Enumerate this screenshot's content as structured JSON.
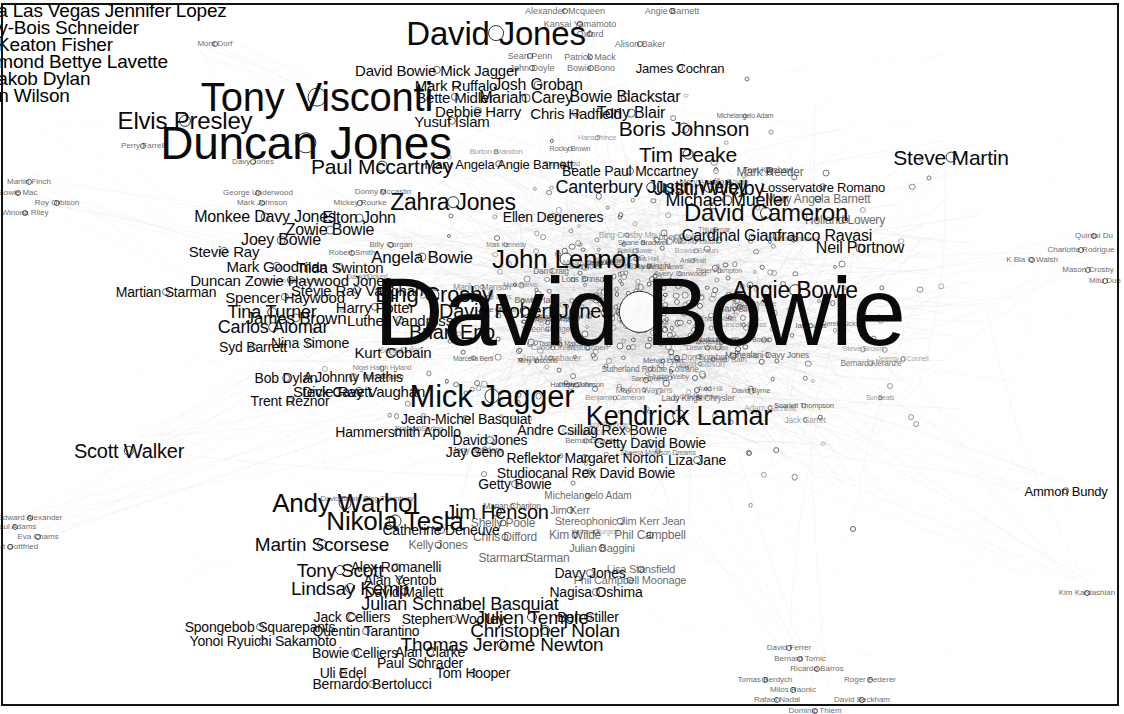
{
  "graph": {
    "title": "David Bowie co-occurrence network",
    "type": "force-directed-label-graph",
    "background": "#ffffff",
    "label_color": "#0a0a0a",
    "node_fill": "#ffffff",
    "node_stroke": "#2b2b2b",
    "edge_color": "#b9b9b9",
    "border_color": "#111111"
  },
  "chart_data": {
    "type": "scatter",
    "xlabel": "",
    "ylabel": "",
    "xlim": [
      0,
      1124
    ],
    "ylim": [
      0,
      714
    ],
    "grid": false,
    "legend": "none",
    "nodes": [
      {
        "label": "David Bowie",
        "x": 640,
        "y": 312,
        "size": 96
      },
      {
        "label": "Duncan Jones",
        "x": 306,
        "y": 143,
        "size": 46
      },
      {
        "label": "Tony Visconti",
        "x": 317,
        "y": 97,
        "size": 40
      },
      {
        "label": "David Jones",
        "x": 496,
        "y": 33,
        "size": 33
      },
      {
        "label": "Mick Jagger",
        "x": 492,
        "y": 396,
        "size": 31
      },
      {
        "label": "Kendrick Lamar",
        "x": 679,
        "y": 416,
        "size": 27
      },
      {
        "label": "John Lennon",
        "x": 566,
        "y": 259,
        "size": 26
      },
      {
        "label": "Andy Warhol",
        "x": 345,
        "y": 503,
        "size": 26
      },
      {
        "label": "Nikola Tesla",
        "x": 395,
        "y": 521,
        "size": 26
      },
      {
        "label": "Elvis Presley",
        "x": 185,
        "y": 121,
        "size": 24
      },
      {
        "label": "David Cameron",
        "x": 766,
        "y": 213,
        "size": 24
      },
      {
        "label": "Zahra Jones",
        "x": 453,
        "y": 202,
        "size": 23
      },
      {
        "label": "Angie Bowie",
        "x": 795,
        "y": 290,
        "size": 23
      },
      {
        "label": "Bing Crosby",
        "x": 434,
        "y": 295,
        "size": 22
      },
      {
        "label": "Paul Mccartney",
        "x": 382,
        "y": 166,
        "size": 21
      },
      {
        "label": "Steve Martin",
        "x": 951,
        "y": 157,
        "size": 21
      },
      {
        "label": "Boris Johnson",
        "x": 684,
        "y": 128,
        "size": 21
      },
      {
        "label": "Tim Peake",
        "x": 688,
        "y": 154,
        "size": 21
      },
      {
        "label": "Justin Welby",
        "x": 709,
        "y": 188,
        "size": 20
      },
      {
        "label": "Scott Walker",
        "x": 129,
        "y": 451,
        "size": 20
      },
      {
        "label": "Jim Henson",
        "x": 497,
        "y": 512,
        "size": 20
      },
      {
        "label": "David Robert Jones",
        "x": 525,
        "y": 311,
        "size": 20
      },
      {
        "label": "Brian Eno",
        "x": 452,
        "y": 332,
        "size": 20
      },
      {
        "label": "Martin Scorsese",
        "x": 322,
        "y": 544,
        "size": 19
      },
      {
        "label": "Lindsay Kemp",
        "x": 350,
        "y": 588,
        "size": 19
      },
      {
        "label": "Tony Scott",
        "x": 340,
        "y": 570,
        "size": 19
      },
      {
        "label": "Thomas Jerome Newton",
        "x": 502,
        "y": 644,
        "size": 19
      },
      {
        "label": "Christopher Nolan",
        "x": 545,
        "y": 630,
        "size": 19
      },
      {
        "label": "Julien Temple",
        "x": 532,
        "y": 617,
        "size": 19
      },
      {
        "label": "Julian Schnabel Basquiat",
        "x": 460,
        "y": 604,
        "size": 18
      },
      {
        "label": "Michael Mueller",
        "x": 727,
        "y": 200,
        "size": 18
      },
      {
        "label": "Canterbury Justin Welby",
        "x": 651,
        "y": 187,
        "size": 18
      },
      {
        "label": "Tina Turner",
        "x": 272,
        "y": 312,
        "size": 18
      },
      {
        "label": "Carlos Alomar",
        "x": 273,
        "y": 327,
        "size": 18
      },
      {
        "label": "James Brown",
        "x": 296,
        "y": 318,
        "size": 17
      },
      {
        "label": "Angela Bowie",
        "x": 422,
        "y": 257,
        "size": 17
      },
      {
        "label": "Monkee Davy Jones",
        "x": 265,
        "y": 217,
        "size": 16
      },
      {
        "label": "Elton John",
        "x": 359,
        "y": 218,
        "size": 16
      },
      {
        "label": "Zowie Bowie",
        "x": 330,
        "y": 230,
        "size": 16
      },
      {
        "label": "Joey Bowie",
        "x": 281,
        "y": 240,
        "size": 16
      },
      {
        "label": "Cardinal Gianfranco Ravasi",
        "x": 777,
        "y": 236,
        "size": 16
      },
      {
        "label": "Neil Portnow",
        "x": 860,
        "y": 248,
        "size": 16
      },
      {
        "label": "Tony Blair",
        "x": 631,
        "y": 113,
        "size": 16
      },
      {
        "label": "Bowie Blackstar",
        "x": 625,
        "y": 97,
        "size": 16
      },
      {
        "label": "Mariah Carey",
        "x": 526,
        "y": 98,
        "size": 16
      },
      {
        "label": "Josh Groban",
        "x": 538,
        "y": 85,
        "size": 16
      },
      {
        "label": "Chris Hadfield",
        "x": 576,
        "y": 113,
        "size": 15
      },
      {
        "label": "Debbie Harry",
        "x": 478,
        "y": 111,
        "size": 15
      },
      {
        "label": "Bette Midler",
        "x": 455,
        "y": 97,
        "size": 15
      },
      {
        "label": "Mark Ruffalo",
        "x": 456,
        "y": 85,
        "size": 15
      },
      {
        "label": "David Bowie Mick Jagger",
        "x": 437,
        "y": 70,
        "size": 15
      },
      {
        "label": "Yusuf Islam",
        "x": 452,
        "y": 121,
        "size": 15
      },
      {
        "label": "Duncan Zowie Haywood Jones",
        "x": 291,
        "y": 280,
        "size": 15
      },
      {
        "label": "Spencer Haywood",
        "x": 285,
        "y": 297,
        "size": 15
      },
      {
        "label": "Mark Goodman",
        "x": 277,
        "y": 266,
        "size": 15
      },
      {
        "label": "Tilda Swinton",
        "x": 340,
        "y": 267,
        "size": 15
      },
      {
        "label": "Stevie Ray Vaughan",
        "x": 359,
        "y": 391,
        "size": 15
      },
      {
        "label": "Stevie Ray Vaughan ",
        "x": 357,
        "y": 290,
        "size": 15
      },
      {
        "label": "Harry Potter",
        "x": 375,
        "y": 307,
        "size": 15
      },
      {
        "label": "Luther Vandross",
        "x": 400,
        "y": 320,
        "size": 15
      },
      {
        "label": "Stevie Ray",
        "x": 224,
        "y": 251,
        "size": 15
      },
      {
        "label": "Martian Starman",
        "x": 166,
        "y": 292,
        "size": 14
      },
      {
        "label": "Kurt Cobain",
        "x": 393,
        "y": 352,
        "size": 15
      },
      {
        "label": "Syd Barrett",
        "x": 253,
        "y": 347,
        "size": 14
      },
      {
        "label": "Nina Simone",
        "x": 310,
        "y": 343,
        "size": 14
      },
      {
        "label": "Bob Dylan",
        "x": 286,
        "y": 378,
        "size": 14
      },
      {
        "label": "A Johnny Mathis",
        "x": 353,
        "y": 377,
        "size": 14
      },
      {
        "label": "Dick Cavett",
        "x": 337,
        "y": 392,
        "size": 14
      },
      {
        "label": "Trent Reznor",
        "x": 290,
        "y": 401,
        "size": 14
      },
      {
        "label": "Hammersmith Apollo",
        "x": 398,
        "y": 432,
        "size": 14
      },
      {
        "label": "Jean-Michel Basquiat",
        "x": 466,
        "y": 419,
        "size": 14
      },
      {
        "label": "David Jones",
        "x": 490,
        "y": 440,
        "size": 14
      },
      {
        "label": "Jay Geno",
        "x": 475,
        "y": 452,
        "size": 14
      },
      {
        "label": "Reflektor Margaret Norton",
        "x": 585,
        "y": 458,
        "size": 14
      },
      {
        "label": "Andre Csillag Rex Bowie",
        "x": 592,
        "y": 430,
        "size": 14
      },
      {
        "label": "Getty David Bowie",
        "x": 650,
        "y": 443,
        "size": 14
      },
      {
        "label": "Liza Jane",
        "x": 697,
        "y": 460,
        "size": 14
      },
      {
        "label": "Studiocanal Rex David Bowie",
        "x": 586,
        "y": 473,
        "size": 14
      },
      {
        "label": "Getty Bowie",
        "x": 515,
        "y": 484,
        "size": 14
      },
      {
        "label": "Catherine Deneuve",
        "x": 441,
        "y": 530,
        "size": 14
      },
      {
        "label": "Alex Romanelli",
        "x": 396,
        "y": 567,
        "size": 14
      },
      {
        "label": "Alan Yentob",
        "x": 400,
        "y": 580,
        "size": 14
      },
      {
        "label": "David Mallett",
        "x": 404,
        "y": 592,
        "size": 14
      },
      {
        "label": "Davy Jones",
        "x": 590,
        "y": 573,
        "size": 14
      },
      {
        "label": "Nagisa Oshima",
        "x": 596,
        "y": 592,
        "size": 14
      },
      {
        "label": "Stephen Woolley",
        "x": 453,
        "y": 619,
        "size": 14
      },
      {
        "label": "Jack Celliers",
        "x": 352,
        "y": 617,
        "size": 14
      },
      {
        "label": "Quentin Tarantino",
        "x": 366,
        "y": 631,
        "size": 14
      },
      {
        "label": "Spongebob Squarepants",
        "x": 260,
        "y": 627,
        "size": 14
      },
      {
        "label": "Yonoi Ryuichi Sakamoto",
        "x": 263,
        "y": 641,
        "size": 14
      },
      {
        "label": "Bowie Celliers",
        "x": 355,
        "y": 653,
        "size": 14
      },
      {
        "label": "Alan Clarke",
        "x": 430,
        "y": 652,
        "size": 14
      },
      {
        "label": "Paul Schrader",
        "x": 420,
        "y": 663,
        "size": 14
      },
      {
        "label": "Uli Edel",
        "x": 343,
        "y": 673,
        "size": 14
      },
      {
        "label": "Bernardo Bertolucci",
        "x": 372,
        "y": 684,
        "size": 14
      },
      {
        "label": "Tom Hooper",
        "x": 473,
        "y": 673,
        "size": 14
      },
      {
        "label": "Ben Stiller",
        "x": 588,
        "y": 617,
        "size": 14
      },
      {
        "label": "Kelly Jones",
        "x": 438,
        "y": 545,
        "size": 12
      },
      {
        "label": "Shelly Poole",
        "x": 503,
        "y": 523,
        "size": 12
      },
      {
        "label": "Chris Difford",
        "x": 505,
        "y": 537,
        "size": 12
      },
      {
        "label": "Starman Starman",
        "x": 524,
        "y": 558,
        "size": 12
      },
      {
        "label": "Lisa Stansfield",
        "x": 641,
        "y": 569,
        "size": 11
      },
      {
        "label": "Phil Campbell Moonage",
        "x": 630,
        "y": 580,
        "size": 11
      },
      {
        "label": "Julian Baggini",
        "x": 602,
        "y": 548,
        "size": 11
      },
      {
        "label": "Phil Campbell",
        "x": 650,
        "y": 535,
        "size": 12
      },
      {
        "label": "Kim Wilde",
        "x": 575,
        "y": 535,
        "size": 12
      },
      {
        "label": "Stereophonic Jim Kerr Jean",
        "x": 620,
        "y": 521,
        "size": 11
      },
      {
        "label": "Jim Kerr",
        "x": 570,
        "y": 510,
        "size": 11
      },
      {
        "label": "Michelangelo Adam",
        "x": 588,
        "y": 496,
        "size": 10
      },
      {
        "label": "Ammon Bundy",
        "x": 1066,
        "y": 491,
        "size": 13
      },
      {
        "label": "Ellen Degeneres",
        "x": 553,
        "y": 217,
        "size": 14
      },
      {
        "label": "Mary Angela Angie Barnett",
        "x": 499,
        "y": 164,
        "size": 13
      },
      {
        "label": "Beatle Paul Mccartney",
        "x": 630,
        "y": 171,
        "size": 14
      },
      {
        "label": "Mark Reeder",
        "x": 770,
        "y": 172,
        "size": 12
      },
      {
        "label": "Losservatore Romano",
        "x": 823,
        "y": 187,
        "size": 13
      },
      {
        "label": "Mary Angela Barnett",
        "x": 818,
        "y": 199,
        "size": 12
      },
      {
        "label": "Holland Lowery",
        "x": 845,
        "y": 220,
        "size": 12
      },
      {
        "label": "James Cochran",
        "x": 680,
        "y": 68,
        "size": 13
      },
      {
        "label": "Alexander Mcqueen",
        "x": 565,
        "y": 11,
        "size": 9
      },
      {
        "label": "Angie Barnett",
        "x": 672,
        "y": 11,
        "size": 9
      },
      {
        "label": "Kansai Yamamoto",
        "x": 580,
        "y": 24,
        "size": 9
      },
      {
        "label": "Oxford",
        "x": 590,
        "y": 34,
        "size": 9
      },
      {
        "label": "Alison Baker",
        "x": 640,
        "y": 44,
        "size": 9
      },
      {
        "label": "Sean Penn",
        "x": 530,
        "y": 56,
        "size": 9
      },
      {
        "label": "Patrick Mack",
        "x": 590,
        "y": 57,
        "size": 9
      },
      {
        "label": "John Doyle",
        "x": 532,
        "y": 68,
        "size": 9
      },
      {
        "label": "Bowie Bono",
        "x": 591,
        "y": 68,
        "size": 9
      },
      {
        "label": "Mont Dorf",
        "x": 215,
        "y": 44,
        "size": 8
      },
      {
        "label": "Perry Farrell",
        "x": 143,
        "y": 146,
        "size": 8
      },
      {
        "label": "Davy Jones",
        "x": 253,
        "y": 162,
        "size": 8
      },
      {
        "label": "Mark Johnson",
        "x": 262,
        "y": 203,
        "size": 8
      },
      {
        "label": "George Underwood",
        "x": 258,
        "y": 193,
        "size": 8
      },
      {
        "label": "Mickey Rourke",
        "x": 360,
        "y": 203,
        "size": 8
      },
      {
        "label": "Donny Mccaslin",
        "x": 383,
        "y": 192,
        "size": 8
      },
      {
        "label": "Billy Corgan",
        "x": 391,
        "y": 245,
        "size": 8
      },
      {
        "label": "Robert Smith",
        "x": 352,
        "y": 253,
        "size": 8
      },
      {
        "label": "Martin Finch",
        "x": 29,
        "y": 182,
        "size": 8
      },
      {
        "label": "Bowie Mac",
        "x": 18,
        "y": 193,
        "size": 8
      },
      {
        "label": "Roy Orbison",
        "x": 57,
        "y": 203,
        "size": 8
      },
      {
        "label": "Winona Riley",
        "x": 25,
        "y": 213,
        "size": 8
      },
      {
        "label": "Edward Alexander",
        "x": 30,
        "y": 518,
        "size": 8
      },
      {
        "label": "Paul Adams",
        "x": 15,
        "y": 527,
        "size": 8
      },
      {
        "label": "Eva Chams",
        "x": 38,
        "y": 537,
        "size": 8
      },
      {
        "label": "Gilbert Gottfried",
        "x": 10,
        "y": 547,
        "size": 8
      },
      {
        "label": "Quintoi Du",
        "x": 1094,
        "y": 236,
        "size": 8
      },
      {
        "label": "Charlotte Rodrigue",
        "x": 1081,
        "y": 250,
        "size": 8
      },
      {
        "label": "K Bla O Walsh",
        "x": 1032,
        "y": 260,
        "size": 8
      },
      {
        "label": "Mason Crosby",
        "x": 1088,
        "y": 270,
        "size": 8
      },
      {
        "label": "Mitu Due",
        "x": 1105,
        "y": 281,
        "size": 8
      },
      {
        "label": "Kim Kardashian",
        "x": 1087,
        "y": 593,
        "size": 8
      },
      {
        "label": "David Ferrer",
        "x": 789,
        "y": 648,
        "size": 8
      },
      {
        "label": "Bernard Tomic",
        "x": 800,
        "y": 659,
        "size": 8
      },
      {
        "label": "Ricardo Barros",
        "x": 817,
        "y": 669,
        "size": 8
      },
      {
        "label": "Tomas Berdych",
        "x": 765,
        "y": 680,
        "size": 8
      },
      {
        "label": "Roger Federer",
        "x": 870,
        "y": 680,
        "size": 8
      },
      {
        "label": "Milos Raonic",
        "x": 793,
        "y": 690,
        "size": 8
      },
      {
        "label": "Rafael Nadal",
        "x": 777,
        "y": 700,
        "size": 8
      },
      {
        "label": "David Beckham",
        "x": 862,
        "y": 700,
        "size": 8
      },
      {
        "label": "Dominic Thiem",
        "x": 815,
        "y": 711,
        "size": 8
      }
    ],
    "featured_largest": "David Bowie",
    "node_count_visible": 400
  },
  "clipped_top_left": [
    "va Las Vegas Jennifer Lopez",
    "oy-Bois Schneider",
    "l Keaton Fisher",
    "smond Bettye Lavette",
    "Jakob Dylan",
    "nn Wilson"
  ],
  "small_labels": [
    "Thiu Brnar",
    "Melvin Lynn",
    "Justin Welby",
    "Avery Garwood",
    "Benjamin Cameron",
    "Mark Bryson",
    "Rhys Ahmad",
    "Jack Garret",
    "Chris Hadfield News",
    "Sean Cullen",
    "Tom Kershaw",
    "Amy Mossbauer",
    "Scarlett Thompson",
    "Chris Cooper",
    "Anil Pratt",
    "Sharon Osbourne",
    "Harriette Johnson",
    "Anthony Burgess",
    "Ian Curtis",
    "Conor Green",
    "Shane Bradwell",
    "Matt Cohen",
    "Laura Albornoz",
    "Franco Spring",
    "Jeremy O'Connell",
    "Morgan Mckennis",
    "Jack Brooks",
    "Judy James",
    "John Partridge",
    "Sam Mance",
    "Naomi Pelludo",
    "Tony Wright",
    "Lady Kings Chrysler",
    "Ruth Collins Hall",
    "Da Don Bomber",
    "Adam Gilchrist",
    "Jonathan Chatman",
    "Stephanie Davis",
    "Avery Coman",
    "Hans Prince",
    "Bernard Aleranze",
    "Chris Appleton",
    "Loris Brinson",
    "Marlon Wayans",
    "Abbey Wells",
    "Burton Brandon",
    "Sun Beats",
    "Miriam Maycock",
    "Tasquira Matos",
    "Marian Chariton",
    "Michelangelo Adam",
    "Sutherland Robbie Coltrane",
    "David Byrne",
    "Mark Kennedy",
    "Peter Frampton",
    "Sheena Morrison Dreams",
    "Derek Kicks",
    "Mahealani Davy Jones",
    "David Ockerl",
    "Mary Angela Bowie",
    "David Gibson",
    "Enisa Walsh",
    "David Bowie",
    "Russell Moore",
    "Dean Cutler",
    "David Bowie Oleg Thornbury",
    "Mark Lennox David Bowie",
    "Bowie Hall",
    "Tony Visconti",
    "Marilyn Manson",
    "Bruce Berg",
    "Nigel Haigh Hyland",
    "Bernard Sauder",
    "Sheena Brigen",
    "Steve Brown",
    "Bowie Braun",
    "Drew Warden",
    "Mark Barker",
    "Charlie Rourke",
    "Lincoln Brass",
    "Sam Quinn",
    "Luciano Bath",
    "Jose Marlon",
    "Redd Boles",
    "Rocky Brown",
    "Dan Craig",
    "Bing Crosby Mc",
    "Marcella Berti",
    "Gary Stiff",
    "Jerry Sanders",
    "Avid Hill"
  ]
}
